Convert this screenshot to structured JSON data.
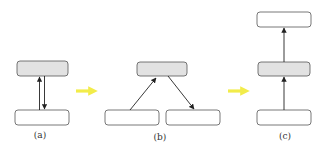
{
  "colors": {
    "box_stroke": "#555555",
    "gray_fill": "#e2e2e2",
    "white_fill": "#ffffff",
    "edge": "#222222",
    "transition_arrow": "#f2ec4a"
  },
  "panels": [
    {
      "label": "(a)",
      "nodes": [
        {
          "id": "a-top",
          "fill": "gray"
        },
        {
          "id": "a-bottom",
          "fill": "white"
        }
      ],
      "edges": [
        {
          "from": "a-bottom",
          "to": "a-top"
        },
        {
          "from": "a-top",
          "to": "a-bottom"
        }
      ]
    },
    {
      "label": "(b)",
      "nodes": [
        {
          "id": "b-top",
          "fill": "gray"
        },
        {
          "id": "b-left",
          "fill": "white"
        },
        {
          "id": "b-right",
          "fill": "white"
        }
      ],
      "edges": [
        {
          "from": "b-left",
          "to": "b-top"
        },
        {
          "from": "b-top",
          "to": "b-right"
        }
      ]
    },
    {
      "label": "(c)",
      "nodes": [
        {
          "id": "c-top",
          "fill": "white"
        },
        {
          "id": "c-middle",
          "fill": "gray"
        },
        {
          "id": "c-bottom",
          "fill": "white"
        }
      ],
      "edges": [
        {
          "from": "c-bottom",
          "to": "c-middle"
        },
        {
          "from": "c-middle",
          "to": "c-top"
        }
      ]
    }
  ],
  "transitions": [
    {
      "from": "(a)",
      "to": "(b)"
    },
    {
      "from": "(b)",
      "to": "(c)"
    }
  ]
}
